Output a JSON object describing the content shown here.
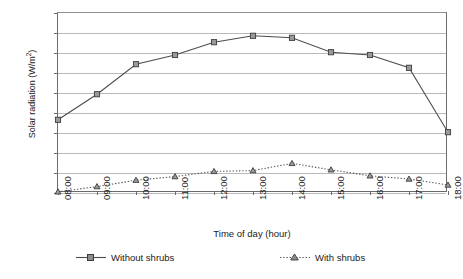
{
  "chart_data": {
    "type": "line",
    "title": "",
    "xlabel": "Time of day (hour)",
    "ylabel": "Solar radiation (W/m²)",
    "ylabel_main": "Solar radiation (W/m",
    "ylabel_sup": "2",
    "ylabel_tail": ")",
    "categories": [
      "08:00",
      "09:00",
      "10:00",
      "11:00",
      "12:00",
      "13:00",
      "14:00",
      "15:00",
      "16:00",
      "17:00",
      "18:00"
    ],
    "yticks": [
      450,
      400,
      350,
      300,
      250,
      200,
      150,
      100,
      50,
      0
    ],
    "ylim": [
      0,
      450
    ],
    "grid": true,
    "legend_position": "bottom",
    "series": [
      {
        "name": "Without shrubs",
        "marker": "square",
        "linestyle": "solid",
        "color": "#4d4d4d",
        "values": [
          183,
          247,
          322,
          345,
          377,
          393,
          388,
          352,
          345,
          313,
          152
        ]
      },
      {
        "name": "With shrubs",
        "marker": "triangle",
        "linestyle": "dotted",
        "color": "#595959",
        "values": [
          3,
          16,
          32,
          41,
          54,
          56,
          74,
          58,
          43,
          35,
          20
        ]
      }
    ]
  },
  "legend": {
    "items": [
      {
        "label": "Without shrubs"
      },
      {
        "label": "With shrubs"
      }
    ]
  },
  "colors": {
    "series_without": "#4d4d4d",
    "series_with": "#595959",
    "gridline": "#b9b9b9",
    "axis": "#6b6b6b",
    "background": "#ffffff"
  }
}
